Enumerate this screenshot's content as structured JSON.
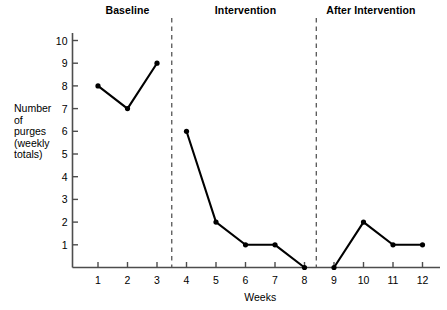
{
  "chart_data": {
    "type": "line",
    "title": "",
    "xlabel": "Weeks",
    "ylabel": "Number of purges (weekly totals)",
    "ylabel_lines": [
      "Number",
      "of",
      "purges",
      "(weekly",
      "totals)"
    ],
    "x": [
      1,
      2,
      3,
      4,
      5,
      6,
      7,
      8,
      9,
      10,
      11,
      12
    ],
    "categories": [
      "1",
      "2",
      "3",
      "4",
      "5",
      "6",
      "7",
      "8",
      "9",
      "10",
      "11",
      "12"
    ],
    "values": [
      8,
      7,
      9,
      6,
      2,
      1,
      1,
      0,
      0,
      2,
      1,
      1
    ],
    "series": [
      {
        "name": "Number of purges (weekly totals)",
        "segments": [
          {
            "phase": "Baseline",
            "x": [
              1,
              2,
              3
            ],
            "values": [
              8,
              7,
              9
            ]
          },
          {
            "phase": "Intervention",
            "x": [
              4,
              5,
              6,
              7,
              8
            ],
            "values": [
              6,
              2,
              1,
              1,
              0
            ]
          },
          {
            "phase": "After Intervention",
            "x": [
              9,
              10,
              11,
              12
            ],
            "values": [
              0,
              2,
              1,
              1
            ]
          }
        ]
      }
    ],
    "ylim": [
      0,
      10.6
    ],
    "xlim": [
      0.4,
      12.6
    ],
    "yticks": [
      1,
      2,
      3,
      4,
      5,
      6,
      7,
      8,
      9,
      10
    ],
    "ytick_labels": [
      "1",
      "2",
      "3",
      "4",
      "5",
      "6",
      "7",
      "8",
      "9",
      "10"
    ],
    "xticks": [
      1,
      2,
      3,
      4,
      5,
      6,
      7,
      8,
      9,
      10,
      11,
      12
    ],
    "xtick_labels": [
      "1",
      "2",
      "3",
      "4",
      "5",
      "6",
      "7",
      "8",
      "9",
      "10",
      "11",
      "12"
    ],
    "grid": false,
    "legend": "none",
    "marker": "filled-circle",
    "line_color": "#000000",
    "marker_color": "#000000",
    "axis_color": "#4d4d4d",
    "phase_divider_color": "#555555",
    "phase_dividers": [
      3.5,
      8.4
    ],
    "phases": [
      {
        "label": "Baseline",
        "x_center": 2.0,
        "x_start": 0.9,
        "x_end": 3.5
      },
      {
        "label": "Intervention",
        "x_center": 6.0,
        "x_start": 3.5,
        "x_end": 8.4
      },
      {
        "label": "After Intervention",
        "x_center": 10.25,
        "x_start": 8.4,
        "x_end": 12.6
      }
    ]
  },
  "phase_headers": [
    {
      "label": "Baseline"
    },
    {
      "label": "Intervention"
    },
    {
      "label": "After Intervention"
    }
  ],
  "axis": {
    "x_title": "Weeks",
    "y_title_lines": [
      {
        "text": "Number"
      },
      {
        "text": "of"
      },
      {
        "text": "purges"
      },
      {
        "text": "(weekly"
      },
      {
        "text": "totals)"
      }
    ]
  }
}
